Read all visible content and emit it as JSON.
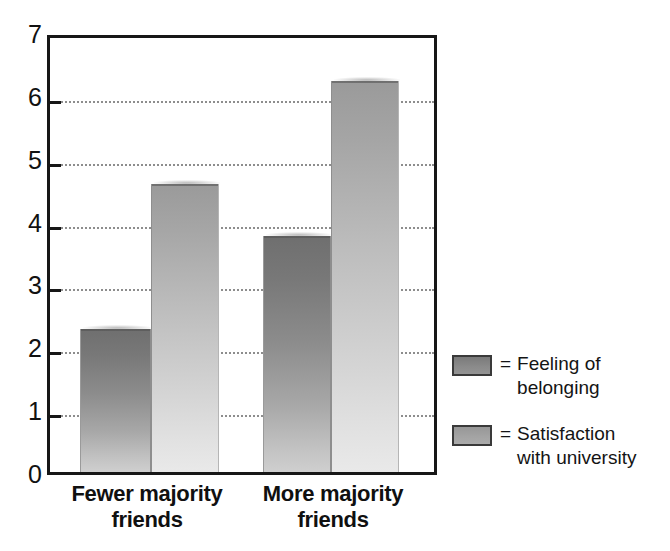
{
  "chart_data": {
    "type": "bar",
    "title": "",
    "subtitle": "",
    "xlabel": "",
    "ylabel": "",
    "categories": [
      "Fewer majority friends",
      "More majority friends"
    ],
    "series": [
      {
        "name": "Feeling of belonging",
        "values": [
          2.3,
          3.8
        ],
        "color": "#8a8a8a"
      },
      {
        "name": "Satisfaction with university",
        "values": [
          4.65,
          6.3
        ],
        "color": "#a8a8a8"
      }
    ],
    "ylim": [
      0,
      7
    ],
    "yticks": [
      0,
      1,
      2,
      3,
      4,
      5,
      6,
      7
    ],
    "ytick_labels": [
      "0",
      "1",
      "2",
      "3",
      "4",
      "5",
      "6",
      "7"
    ],
    "grid": true,
    "grid_style": "dotted-horizontal",
    "grid_values": [
      1,
      2,
      3,
      4,
      5,
      6
    ],
    "legend_position": "right",
    "legend_prefix": "=",
    "annotations": []
  },
  "axis": {
    "y_tick_labels": [
      "7",
      "6",
      "5",
      "4",
      "3",
      "2",
      "1",
      "0"
    ]
  },
  "x_labels": [
    {
      "line1": "Fewer majority",
      "line2": "friends"
    },
    {
      "line1": "More majority",
      "line2": "friends"
    }
  ],
  "legend": {
    "items": [
      {
        "equals": "=",
        "label": "Feeling of\nbelonging",
        "swatch_color": "#8a8a8a"
      },
      {
        "equals": "=",
        "label": "Satisfaction\nwith university",
        "swatch_color": "#a8a8a8"
      }
    ]
  }
}
